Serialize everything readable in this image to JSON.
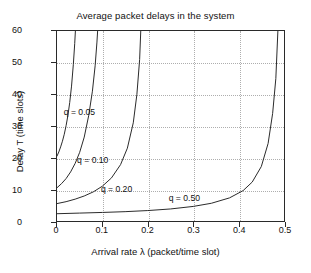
{
  "chart_data": {
    "type": "line",
    "title": "Average packet delays in the system",
    "xlabel": "Arrival rate λ (packet/time slot)",
    "ylabel": "Delay T (time slots)",
    "xlim": [
      0,
      0.5
    ],
    "ylim": [
      0,
      60
    ],
    "xticks": [
      0,
      0.1,
      0.2,
      0.3,
      0.4,
      0.5
    ],
    "xtick_labels": [
      "0",
      "0.1",
      "0.2",
      "0.3",
      "0.4",
      "0.5"
    ],
    "yticks": [
      0,
      10,
      20,
      30,
      40,
      50,
      60
    ],
    "ytick_labels": [
      "0",
      "10",
      "20",
      "30",
      "40",
      "50",
      "60"
    ],
    "grid": true,
    "grid_style": "dotted",
    "grid_color": "#aeaeae",
    "legend": "inline-curve-labels",
    "line_color": "#2a2a2a",
    "series": [
      {
        "name": "q = 0.05",
        "q": 0.05,
        "label": "q = 0.05",
        "label_x": 0.017,
        "label_y": 34.5,
        "asymptote_lambda": 0.0475,
        "y_at_zero": 20.5,
        "points": [
          [
            0.0,
            20.5
          ],
          [
            0.004,
            21.8
          ],
          [
            0.008,
            23.4
          ],
          [
            0.012,
            25.2
          ],
          [
            0.016,
            27.4
          ],
          [
            0.02,
            30.1
          ],
          [
            0.024,
            33.3
          ],
          [
            0.028,
            37.4
          ],
          [
            0.032,
            42.6
          ],
          [
            0.036,
            49.5
          ],
          [
            0.039,
            56.0
          ],
          [
            0.0405,
            60.0
          ]
        ]
      },
      {
        "name": "q = 0.10",
        "q": 0.1,
        "label": "q = 0.10",
        "label_x": 0.046,
        "label_y": 19.5,
        "asymptote_lambda": 0.095,
        "y_at_zero": 10.5,
        "points": [
          [
            0.0,
            10.5
          ],
          [
            0.01,
            11.8
          ],
          [
            0.02,
            13.4
          ],
          [
            0.03,
            15.5
          ],
          [
            0.04,
            18.2
          ],
          [
            0.05,
            21.7
          ],
          [
            0.06,
            26.5
          ],
          [
            0.07,
            33.4
          ],
          [
            0.078,
            41.0
          ],
          [
            0.084,
            49.0
          ],
          [
            0.088,
            56.5
          ],
          [
            0.0895,
            60.0
          ]
        ]
      },
      {
        "name": "q = 0.20",
        "q": 0.2,
        "label": "q = 0.20",
        "label_x": 0.098,
        "label_y": 10.2,
        "asymptote_lambda": 0.19,
        "y_at_zero": 5.5,
        "points": [
          [
            0.0,
            5.5
          ],
          [
            0.02,
            6.1
          ],
          [
            0.04,
            6.9
          ],
          [
            0.06,
            7.9
          ],
          [
            0.08,
            9.2
          ],
          [
            0.1,
            11.0
          ],
          [
            0.12,
            13.6
          ],
          [
            0.14,
            17.8
          ],
          [
            0.155,
            23.0
          ],
          [
            0.168,
            31.0
          ],
          [
            0.176,
            40.0
          ],
          [
            0.182,
            51.0
          ],
          [
            0.1845,
            60.0
          ]
        ]
      },
      {
        "name": "q = 0.50",
        "q": 0.5,
        "label": "q = 0.50",
        "label_x": 0.246,
        "label_y": 7.4,
        "asymptote_lambda": 0.49,
        "y_at_zero": 2.3,
        "points": [
          [
            0.0,
            2.3
          ],
          [
            0.05,
            2.5
          ],
          [
            0.1,
            2.7
          ],
          [
            0.15,
            2.95
          ],
          [
            0.2,
            3.3
          ],
          [
            0.25,
            3.8
          ],
          [
            0.3,
            4.6
          ],
          [
            0.34,
            5.6
          ],
          [
            0.38,
            7.3
          ],
          [
            0.41,
            9.6
          ],
          [
            0.43,
            12.3
          ],
          [
            0.45,
            17.2
          ],
          [
            0.465,
            24.5
          ],
          [
            0.475,
            34.0
          ],
          [
            0.482,
            45.0
          ],
          [
            0.4865,
            60.0
          ]
        ]
      }
    ]
  }
}
